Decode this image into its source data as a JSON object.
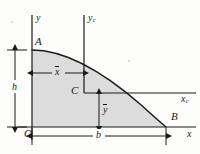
{
  "figure": {
    "background_color": "#fdfdfb",
    "shade_color": "#dcdcdc",
    "line_color": "#1a1a1a"
  },
  "axes": [
    {
      "name": "y-axis",
      "label": "y",
      "subscript": "",
      "orientation": "vertical",
      "x": 32,
      "y1": 15,
      "y2": 140
    },
    {
      "name": "yc-axis",
      "label": "y",
      "subscript": "c",
      "orientation": "vertical",
      "x": 84,
      "y1": 15,
      "y2": 93
    },
    {
      "name": "x-axis",
      "label": "x",
      "subscript": "",
      "orientation": "horizontal",
      "y": 127,
      "x1": 18,
      "x2": 196
    },
    {
      "name": "xc-axis",
      "label": "x",
      "subscript": "c",
      "orientation": "horizontal",
      "y": 93,
      "x1": 84,
      "x2": 196
    }
  ],
  "points": [
    {
      "id": "A",
      "label": "A",
      "x": 32,
      "y": 50,
      "description": "top of curve on y-axis"
    },
    {
      "id": "B",
      "label": "B",
      "x": 166,
      "y": 127,
      "description": "base of curve on x-axis"
    },
    {
      "id": "C",
      "label": "C",
      "x": 84,
      "y": 93,
      "description": "centroid"
    },
    {
      "id": "O",
      "label": "O",
      "x": 32,
      "y": 127,
      "description": "origin"
    }
  ],
  "dimensions": [
    {
      "id": "h",
      "label": "h",
      "overbar": false,
      "orientation": "vertical",
      "from": 50,
      "to": 127,
      "at": 15,
      "description": "height of area"
    },
    {
      "id": "b",
      "label": "b",
      "overbar": false,
      "orientation": "horizontal",
      "from": 32,
      "to": 166,
      "at": 136,
      "description": "base width of area"
    },
    {
      "id": "xbar",
      "label": "x",
      "overbar": true,
      "orientation": "horizontal",
      "from": 32,
      "to": 84,
      "at": 73,
      "description": "centroid x distance"
    },
    {
      "id": "ybar",
      "label": "y",
      "overbar": true,
      "orientation": "vertical",
      "from": 93,
      "to": 127,
      "at": 99,
      "description": "centroid y distance"
    }
  ],
  "region": {
    "name": "shaded-area",
    "fill": "#dcdcdc",
    "stroke": "#1a1a1a",
    "curve": "parabolic arc from A(32,50) to B(166,127)"
  }
}
